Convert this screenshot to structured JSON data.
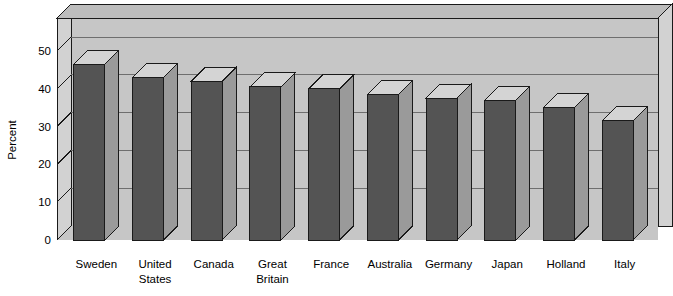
{
  "chart_data": {
    "type": "bar",
    "title": "",
    "subtitle": "",
    "xlabel": "",
    "ylabel": "Percent",
    "ylim": [
      0,
      57
    ],
    "yticks": [
      0,
      10,
      20,
      30,
      40,
      50
    ],
    "ytick_labels": [
      "0",
      "10",
      "20",
      "30",
      "40",
      "50"
    ],
    "grid": true,
    "grid_axis": "y",
    "legend": false,
    "legend_position": "none",
    "style": "3d-bar",
    "categories": [
      "Sweden",
      "United States",
      "Canada",
      "Great Britain",
      "France",
      "Australia",
      "Germany",
      "Japan",
      "Holland",
      "Italy"
    ],
    "category_lines": [
      [
        "Sweden"
      ],
      [
        "United",
        "States"
      ],
      [
        "Canada"
      ],
      [
        "Great",
        "Britain"
      ],
      [
        "France"
      ],
      [
        "Australia"
      ],
      [
        "Germany"
      ],
      [
        "Japan"
      ],
      [
        "Holland"
      ],
      [
        "Italy"
      ]
    ],
    "values": [
      46.5,
      43,
      42,
      40.5,
      40,
      38.5,
      37.5,
      37,
      35,
      31.5
    ],
    "series": [
      {
        "name": "Percent",
        "values": [
          46.5,
          43,
          42,
          40.5,
          40,
          38.5,
          37.5,
          37,
          35,
          31.5
        ]
      }
    ]
  },
  "colors": {
    "bar_face": "#545454",
    "bar_top": "#d4d4d4",
    "bar_side": "#9a9a9a",
    "plot_back": "#c6c6c6",
    "plot_top": "#bdbdbd",
    "plot_side": "#d2d2d2",
    "grid_line": "#6e6e6e",
    "outline": "#1a1a1a",
    "page_background": "#ffffff",
    "text": "#000000"
  },
  "axis": {
    "y_label": "Percent"
  }
}
